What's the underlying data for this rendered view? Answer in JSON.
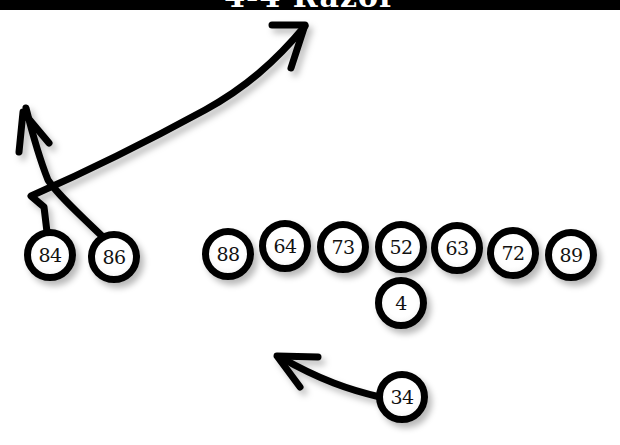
{
  "title": "4-4 Razor",
  "diagram": {
    "type": "football-play",
    "colors": {
      "ink": "#000000",
      "background": "#ffffff"
    },
    "players": [
      {
        "id": "p84",
        "number": "84",
        "x": 53,
        "y": 258
      },
      {
        "id": "p86",
        "number": "86",
        "x": 117,
        "y": 260
      },
      {
        "id": "p88",
        "number": "88",
        "x": 231,
        "y": 257
      },
      {
        "id": "p64",
        "number": "64",
        "x": 288,
        "y": 249
      },
      {
        "id": "p73",
        "number": "73",
        "x": 346,
        "y": 250
      },
      {
        "id": "p52",
        "number": "52",
        "x": 404,
        "y": 250
      },
      {
        "id": "p63",
        "number": "63",
        "x": 460,
        "y": 251
      },
      {
        "id": "p72",
        "number": "72",
        "x": 516,
        "y": 256
      },
      {
        "id": "p89",
        "number": "89",
        "x": 574,
        "y": 258
      },
      {
        "id": "p4",
        "number": "4",
        "x": 404,
        "y": 306
      },
      {
        "id": "p34",
        "number": "34",
        "x": 405,
        "y": 400
      }
    ],
    "routes": [
      {
        "from": "84",
        "description": "short stem then deep post/corner route to upper right"
      },
      {
        "from": "86",
        "description": "crossing up-field then vertical route upper left"
      },
      {
        "from": "34",
        "description": "curved swing/run to the left"
      }
    ]
  }
}
